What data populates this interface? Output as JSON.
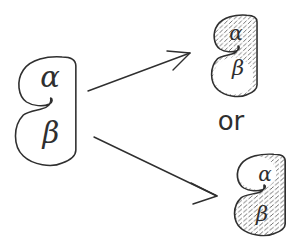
{
  "figure": {
    "source": {
      "alpha": "α",
      "beta": "β"
    },
    "connector": "or",
    "outcome_top_alpha_marked": {
      "alpha": "α",
      "beta": "β"
    },
    "outcome_bottom_beta_marked": {
      "alpha": "α",
      "beta": "β"
    }
  },
  "colors": {
    "ink": "#2f2f2f",
    "hatch": "#4d4d4d",
    "background": "#ffffff"
  }
}
